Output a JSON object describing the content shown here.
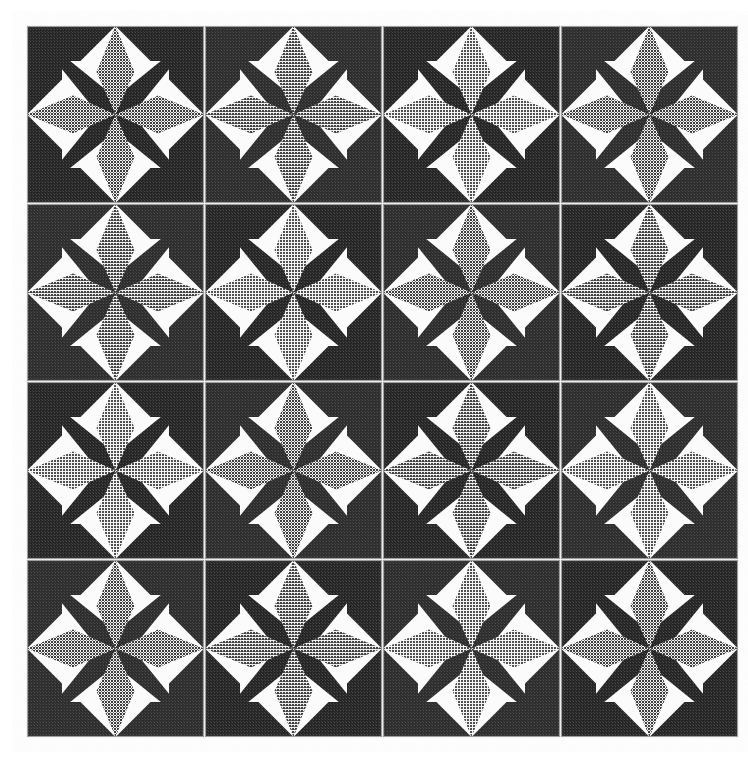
{
  "image": {
    "title": "Geometric star tile pattern",
    "description": "A 4 by 4 grid of square ceramic tiles photographed flat. Each tile bears a symmetrical eight-pointed star motif rendered in halftone screen tones.",
    "width": 748,
    "height": 761,
    "background_color": "#ffffff"
  },
  "grid": {
    "name": "tile-grid",
    "columns": 4,
    "rows": 4,
    "origin_x": 27,
    "origin_y": 26,
    "tile_size": 177,
    "gap": 1,
    "total_tiles": 16
  },
  "palette": {
    "dark": "#2b2b2b",
    "dark_alt": "#333333",
    "gray": "#9a9a9a",
    "gray_light": "#b0b0b0",
    "white": "#fbfbfb",
    "tile_border": "#9e9e9e",
    "grout": "#e8e8e8",
    "background": "#ffffff"
  },
  "motif": {
    "name": "eight-pointed-star-tile",
    "description": "Eight pointed star at tile centre with four dark diagonal points and four grey orthogonal points, four dark corner triangles with inward apex, and four white squares filling the quadrants.",
    "elements": [
      {
        "id": "corner-triangle-nw",
        "shape": "triangle",
        "tone": "dark",
        "count": 1
      },
      {
        "id": "corner-triangle-ne",
        "shape": "triangle",
        "tone": "dark",
        "count": 1
      },
      {
        "id": "corner-triangle-sw",
        "shape": "triangle",
        "tone": "dark",
        "count": 1
      },
      {
        "id": "corner-triangle-se",
        "shape": "triangle",
        "tone": "dark",
        "count": 1
      },
      {
        "id": "star-point-n",
        "shape": "elongated-diamond",
        "tone": "gray",
        "count": 1
      },
      {
        "id": "star-point-s",
        "shape": "elongated-diamond",
        "tone": "gray",
        "count": 1
      },
      {
        "id": "star-point-e",
        "shape": "elongated-diamond",
        "tone": "gray",
        "count": 1
      },
      {
        "id": "star-point-w",
        "shape": "elongated-diamond",
        "tone": "gray",
        "count": 1
      },
      {
        "id": "star-point-nw",
        "shape": "kite",
        "tone": "dark",
        "count": 1
      },
      {
        "id": "star-point-ne",
        "shape": "kite",
        "tone": "dark",
        "count": 1
      },
      {
        "id": "star-point-sw",
        "shape": "kite",
        "tone": "dark",
        "count": 1
      },
      {
        "id": "star-point-se",
        "shape": "kite",
        "tone": "dark",
        "count": 1
      },
      {
        "id": "white-square-nw",
        "shape": "square",
        "tone": "white",
        "count": 1
      },
      {
        "id": "white-square-ne",
        "shape": "square",
        "tone": "white",
        "count": 1
      },
      {
        "id": "white-square-sw",
        "shape": "square",
        "tone": "white",
        "count": 1
      },
      {
        "id": "white-square-se",
        "shape": "square",
        "tone": "white",
        "count": 1
      }
    ],
    "geometry": {
      "star_point_half_width": 19,
      "star_point_waist": 0.48,
      "corner_triangle_inset": 0,
      "white_square_inner": 35,
      "white_square_outer": 78
    }
  },
  "tiles": [
    {
      "row": 0,
      "col": 0,
      "name": "tile-r1-c1",
      "gray_tone": "#9a9a9a",
      "dark_tone": "#2e2e2e"
    },
    {
      "row": 0,
      "col": 1,
      "name": "tile-r1-c2",
      "gray_tone": "#9a9a9a",
      "dark_tone": "#2b2b2b"
    },
    {
      "row": 0,
      "col": 2,
      "name": "tile-r1-c3",
      "gray_tone": "#b2b2b2",
      "dark_tone": "#2b2b2b"
    },
    {
      "row": 0,
      "col": 3,
      "name": "tile-r1-c4",
      "gray_tone": "#a2a2a2",
      "dark_tone": "#2e2e2e"
    },
    {
      "row": 1,
      "col": 0,
      "name": "tile-r2-c1",
      "gray_tone": "#9a9a9a",
      "dark_tone": "#303030"
    },
    {
      "row": 1,
      "col": 1,
      "name": "tile-r2-c2",
      "gray_tone": "#a0a0a0",
      "dark_tone": "#2b2b2b"
    },
    {
      "row": 1,
      "col": 2,
      "name": "tile-r2-c3",
      "gray_tone": "#a8a8a8",
      "dark_tone": "#2e2e2e"
    },
    {
      "row": 1,
      "col": 3,
      "name": "tile-r2-c4",
      "gray_tone": "#9c9c9c",
      "dark_tone": "#2b2b2b"
    },
    {
      "row": 2,
      "col": 0,
      "name": "tile-r3-c1",
      "gray_tone": "#9a9a9a",
      "dark_tone": "#2b2b2b"
    },
    {
      "row": 2,
      "col": 1,
      "name": "tile-r3-c2",
      "gray_tone": "#a4a4a4",
      "dark_tone": "#2e2e2e"
    },
    {
      "row": 2,
      "col": 2,
      "name": "tile-r3-c3",
      "gray_tone": "#9e9e9e",
      "dark_tone": "#2b2b2b"
    },
    {
      "row": 2,
      "col": 3,
      "name": "tile-r3-c4",
      "gray_tone": "#a0a0a0",
      "dark_tone": "#303030"
    },
    {
      "row": 3,
      "col": 0,
      "name": "tile-r4-c1",
      "gray_tone": "#9c9c9c",
      "dark_tone": "#2b2b2b"
    },
    {
      "row": 3,
      "col": 1,
      "name": "tile-r4-c2",
      "gray_tone": "#a2a2a2",
      "dark_tone": "#2e2e2e"
    },
    {
      "row": 3,
      "col": 2,
      "name": "tile-r4-c3",
      "gray_tone": "#b0b0b0",
      "dark_tone": "#2b2b2b"
    },
    {
      "row": 3,
      "col": 3,
      "name": "tile-r4-c4",
      "gray_tone": "#9e9e9e",
      "dark_tone": "#2e2e2e"
    }
  ]
}
